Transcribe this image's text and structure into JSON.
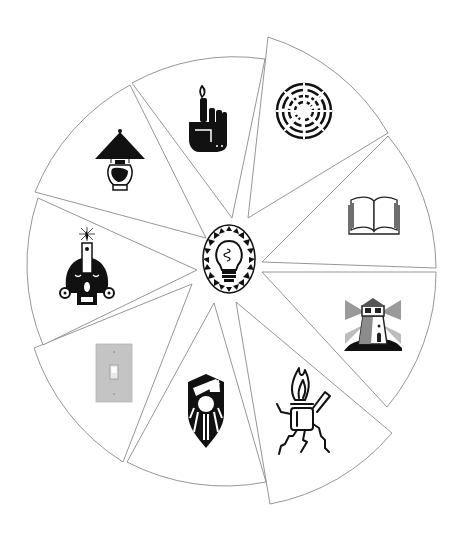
{
  "diagram": {
    "type": "exploded-wheel",
    "title": "",
    "background": "#ffffff",
    "outline_color": "#8a8a8a",
    "center": {
      "icon": "light-bulb-icon",
      "label": ""
    },
    "segments": [
      {
        "id": "book",
        "icon": "open-book-icon",
        "label": ""
      },
      {
        "id": "lighthouse",
        "icon": "lighthouse-icon",
        "label": ""
      },
      {
        "id": "lighter",
        "icon": "lighter-flame-icon",
        "label": ""
      },
      {
        "id": "shield",
        "icon": "sun-shield-icon",
        "label": ""
      },
      {
        "id": "switch",
        "icon": "light-switch-icon",
        "label": ""
      },
      {
        "id": "plug-candle",
        "icon": "plug-candle-icon",
        "label": ""
      },
      {
        "id": "lamp",
        "icon": "table-lamp-icon",
        "label": ""
      },
      {
        "id": "hand-candle",
        "icon": "finger-candle-icon",
        "label": ""
      },
      {
        "id": "spiral",
        "icon": "radial-spiral-icon",
        "label": ""
      }
    ]
  }
}
